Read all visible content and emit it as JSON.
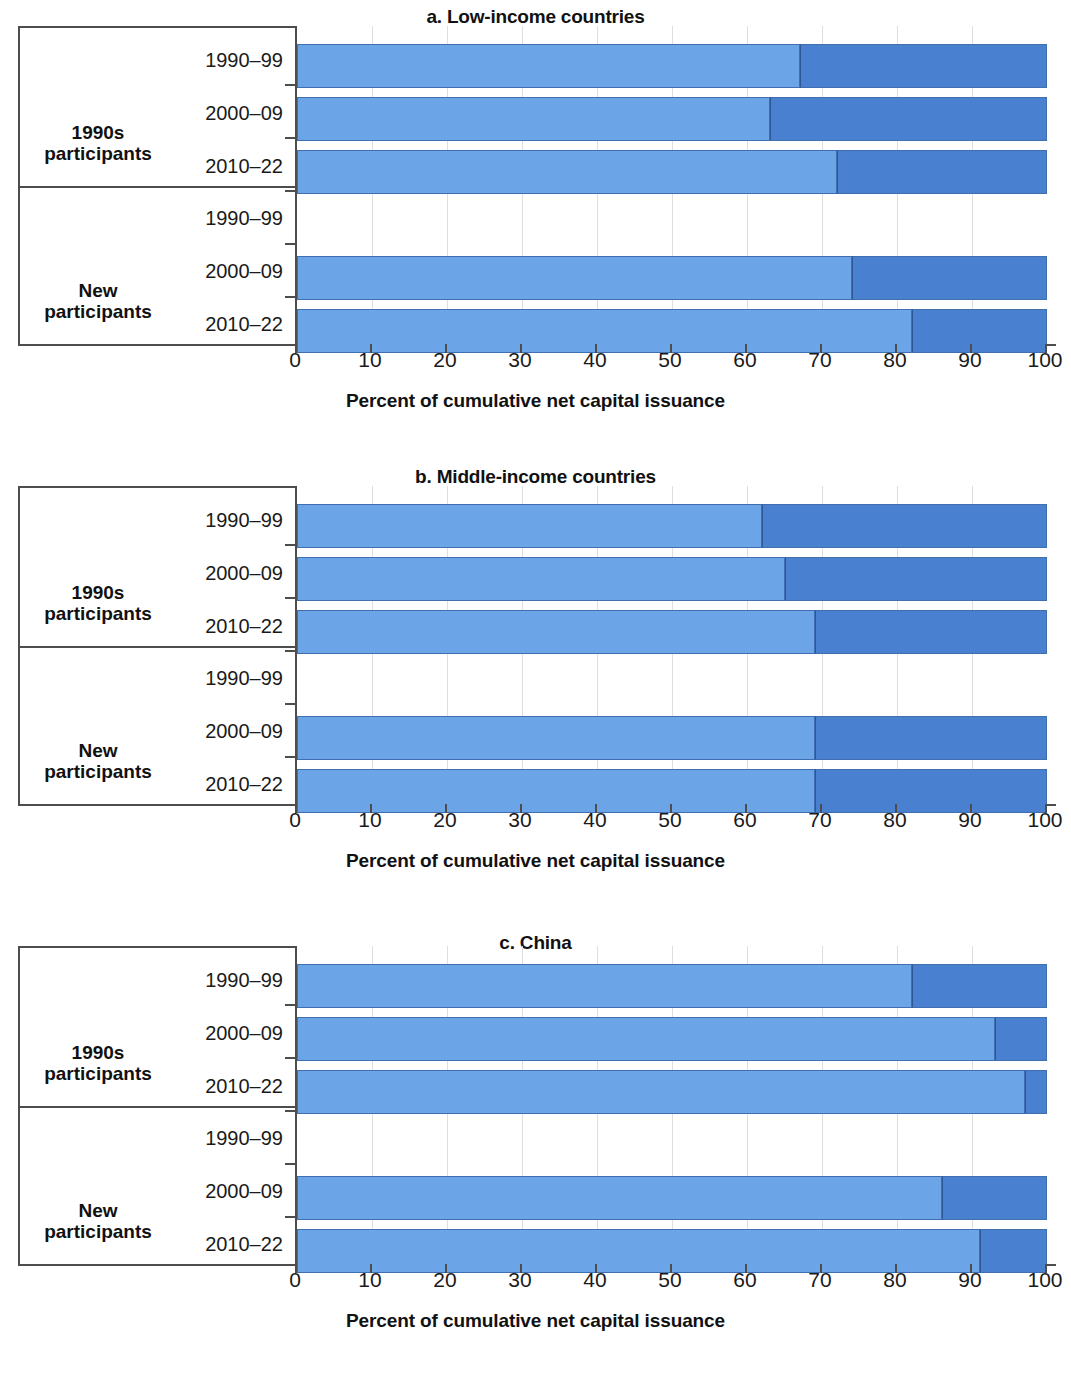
{
  "panels": [
    {
      "id": "a",
      "title": "a. Low-income countries",
      "axis_caption": "Percent of cumulative net capital issuance"
    },
    {
      "id": "b",
      "title": "b. Middle-income countries",
      "axis_caption": "Percent of cumulative net capital issuance"
    },
    {
      "id": "c",
      "title": "c. China",
      "axis_caption": "Percent of cumulative net capital issuance"
    }
  ],
  "groups": {
    "g1": "1990s\nparticipants",
    "g1_line1": "1990s",
    "g1_line2": "participants",
    "g2_line1": "New",
    "g2_line2": "participants"
  },
  "periods": [
    "1990–99",
    "2000–09",
    "2010–22"
  ],
  "xticks": [
    "0",
    "10",
    "20",
    "30",
    "40",
    "50",
    "60",
    "70",
    "80",
    "90",
    "100"
  ],
  "colors": {
    "light_segment": "#6ba5e8",
    "dark_segment": "#4a80d0",
    "axis": "#4d4d4d",
    "gridline": "#dedede"
  },
  "chart_data": [
    {
      "type": "bar",
      "subtype": "stacked-horizontal-100-percent",
      "title": "a. Low-income countries",
      "xlabel": "Percent of cumulative net capital issuance",
      "ylabel": "",
      "xlim": [
        0,
        100
      ],
      "xticks": [
        0,
        10,
        20,
        30,
        40,
        50,
        60,
        70,
        80,
        90,
        100
      ],
      "grid": true,
      "legend": "none",
      "groups": [
        "1990s participants",
        "New participants"
      ],
      "categories": [
        "1990s participants / 1990–99",
        "1990s participants / 2000–09",
        "1990s participants / 2010–22",
        "New participants / 1990–99",
        "New participants / 2000–09",
        "New participants / 2010–22"
      ],
      "series": [
        {
          "name": "light-segment",
          "values": [
            67,
            63,
            72,
            null,
            74,
            82
          ]
        },
        {
          "name": "dark-segment",
          "values": [
            33,
            37,
            28,
            null,
            26,
            18
          ]
        }
      ]
    },
    {
      "type": "bar",
      "subtype": "stacked-horizontal-100-percent",
      "title": "b. Middle-income countries",
      "xlabel": "Percent of cumulative net capital issuance",
      "ylabel": "",
      "xlim": [
        0,
        100
      ],
      "xticks": [
        0,
        10,
        20,
        30,
        40,
        50,
        60,
        70,
        80,
        90,
        100
      ],
      "grid": true,
      "legend": "none",
      "groups": [
        "1990s participants",
        "New participants"
      ],
      "categories": [
        "1990s participants / 1990–99",
        "1990s participants / 2000–09",
        "1990s participants / 2010–22",
        "New participants / 1990–99",
        "New participants / 2000–09",
        "New participants / 2010–22"
      ],
      "series": [
        {
          "name": "light-segment",
          "values": [
            62,
            65,
            69,
            null,
            69,
            69
          ]
        },
        {
          "name": "dark-segment",
          "values": [
            38,
            35,
            31,
            null,
            31,
            31
          ]
        }
      ]
    },
    {
      "type": "bar",
      "subtype": "stacked-horizontal-100-percent",
      "title": "c. China",
      "xlabel": "Percent of cumulative net capital issuance",
      "ylabel": "",
      "xlim": [
        0,
        100
      ],
      "xticks": [
        0,
        10,
        20,
        30,
        40,
        50,
        60,
        70,
        80,
        90,
        100
      ],
      "grid": true,
      "legend": "none",
      "groups": [
        "1990s participants",
        "New participants"
      ],
      "categories": [
        "1990s participants / 1990–99",
        "1990s participants / 2000–09",
        "1990s participants / 2010–22",
        "New participants / 1990–99",
        "New participants / 2000–09",
        "New participants / 2010–22"
      ],
      "series": [
        {
          "name": "light-segment",
          "values": [
            82,
            93,
            97,
            null,
            86,
            91
          ]
        },
        {
          "name": "dark-segment",
          "values": [
            18,
            7,
            3,
            null,
            14,
            9
          ]
        }
      ]
    }
  ]
}
